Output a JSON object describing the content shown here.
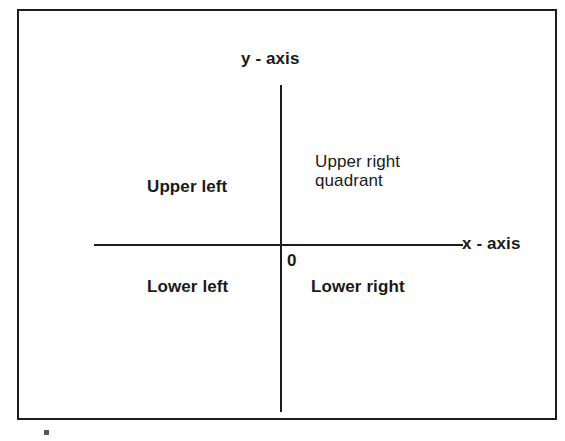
{
  "diagram": {
    "background_color": "#ffffff",
    "line_color": "#1c1c1c",
    "text_color": "#1a1a1a",
    "frame": {
      "name": "outer-border-rectangle",
      "border_width_px": 2
    },
    "axes": {
      "x_axis_label": "x - axis",
      "y_axis_label": "y - axis",
      "origin_label": "0"
    },
    "quadrants": [
      {
        "key": "upper_left",
        "label": "Upper left",
        "weight": "bold"
      },
      {
        "key": "upper_right",
        "label": "Upper right\nquadrant",
        "weight": "regular"
      },
      {
        "key": "lower_left",
        "label": "Lower left",
        "weight": "bold"
      },
      {
        "key": "lower_right",
        "label": "Lower right",
        "weight": "bold"
      }
    ]
  },
  "chart_data": {
    "type": "diagram",
    "title": "",
    "xlabel": "x - axis",
    "ylabel": "y - axis",
    "origin": "0",
    "grid": false,
    "legend": "none",
    "annotations": [
      {
        "text": "y - axis",
        "position": "top-center, above y-axis"
      },
      {
        "text": "x - axis",
        "position": "right end of x-axis"
      },
      {
        "text": "Upper left",
        "position": "quadrant II"
      },
      {
        "text": "Upper right",
        "position": "quadrant I, line 1"
      },
      {
        "text": "quadrant",
        "position": "quadrant I, line 2"
      },
      {
        "text": "0",
        "position": "origin, below-right of intersection"
      },
      {
        "text": "Lower left",
        "position": "quadrant III"
      },
      {
        "text": "Lower right",
        "position": "quadrant IV"
      }
    ]
  }
}
